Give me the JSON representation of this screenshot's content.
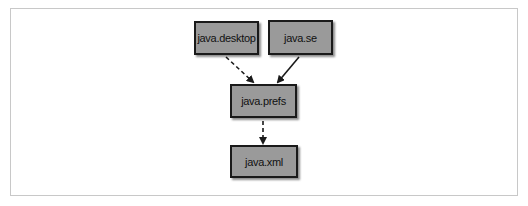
{
  "diagram": {
    "nodes": [
      {
        "id": "desktop",
        "label": "java.desktop"
      },
      {
        "id": "se",
        "label": "java.se"
      },
      {
        "id": "prefs",
        "label": "java.prefs"
      },
      {
        "id": "xml",
        "label": "java.xml"
      }
    ],
    "edges": [
      {
        "from": "java.desktop",
        "to": "java.prefs",
        "style": "dashed"
      },
      {
        "from": "java.se",
        "to": "java.prefs",
        "style": "solid"
      },
      {
        "from": "java.prefs",
        "to": "java.xml",
        "style": "dashed"
      }
    ],
    "colors": {
      "node_fill": "#9a9a9a",
      "node_border": "#1a1a1a",
      "frame": "#c8c8c8"
    }
  }
}
